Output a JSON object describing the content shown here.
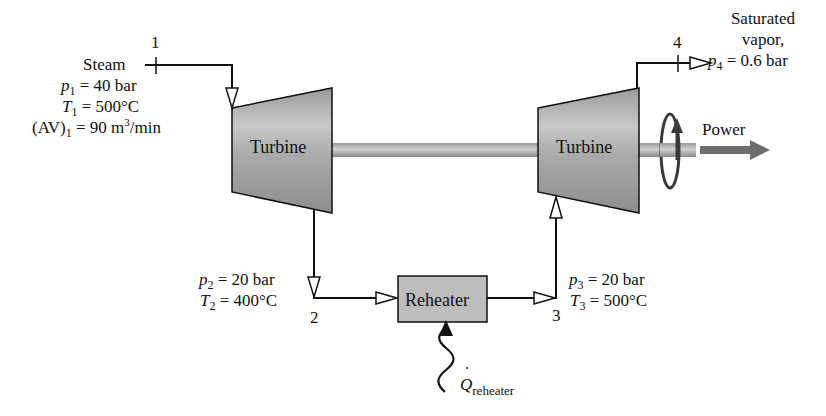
{
  "diagram": {
    "type": "reheat steam turbine schematic",
    "components": {
      "turbine_hp": {
        "label": "Turbine"
      },
      "turbine_lp": {
        "label": "Turbine"
      },
      "reheater": {
        "label": "Reheater"
      },
      "power": {
        "label": "Power"
      },
      "heat_input": {
        "symbol": "Q",
        "subscript": "reheater"
      }
    },
    "states": {
      "s1": {
        "number": "1",
        "fluid": "Steam",
        "p": {
          "sym": "p",
          "sub": "1",
          "eq": " = 40 bar"
        },
        "T": {
          "sym": "T",
          "sub": "1",
          "eq": " = 500°C"
        },
        "AV": {
          "prefix": "(AV)",
          "sub": "1",
          "eq": " = 90 m",
          "sup": "3",
          "unit": "/min"
        }
      },
      "s2": {
        "number": "2",
        "p": {
          "sym": "p",
          "sub": "2",
          "eq": " = 20 bar"
        },
        "T": {
          "sym": "T",
          "sub": "2",
          "eq": " = 400°C"
        }
      },
      "s3": {
        "number": "3",
        "p": {
          "sym": "p",
          "sub": "3",
          "eq": " = 20 bar"
        },
        "T": {
          "sym": "T",
          "sub": "3",
          "eq": " = 500°C"
        }
      },
      "s4": {
        "number": "4",
        "line1": "Saturated",
        "line2": "vapor,",
        "p": {
          "sym": "p",
          "sub": "4",
          "eq": " = 0.6 bar"
        }
      }
    },
    "colors": {
      "line": "#111111",
      "turbine_fill": "#a8a8a8",
      "turbine_highlight": "#d4d4d4",
      "shaft": "#b5b5b5",
      "reheater_fill": "#bdbdbd",
      "power_arrow": "#6e6e6e",
      "rotation": "#3a3a3a"
    }
  }
}
